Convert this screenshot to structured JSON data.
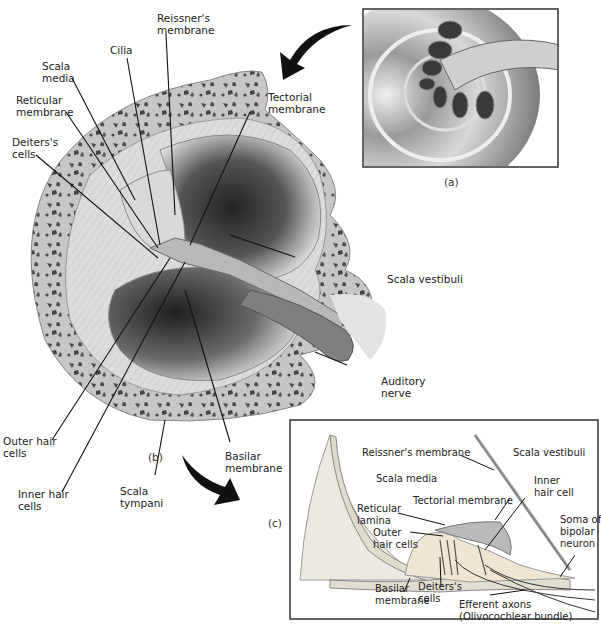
{
  "figure": {
    "panels": {
      "a": {
        "caption": "(a)",
        "subject": "coiled cochlea with auditory nerve"
      },
      "b": {
        "caption": "(b)",
        "subject": "cross-section of one cochlear turn"
      },
      "c": {
        "caption": "(c)",
        "subject": "organ of Corti detail"
      }
    }
  },
  "labels_b": {
    "reissners_membrane": [
      "Reissner's",
      "membrane"
    ],
    "cilia": [
      "Cilia"
    ],
    "scala_media": [
      "Scala",
      "media"
    ],
    "reticular_membrane": [
      "Reticular",
      "membrane"
    ],
    "deiters_cells": [
      "Deiters's",
      "cells"
    ],
    "tectorial_membrane": [
      "Tectorial",
      "membrane"
    ],
    "scala_vestibuli": [
      "Scala vestibuli"
    ],
    "auditory_nerve": [
      "Auditory",
      "nerve"
    ],
    "outer_hair_cells": [
      "Outer hair",
      "cells"
    ],
    "inner_hair_cells": [
      "Inner hair",
      "cells"
    ],
    "scala_tympani": [
      "Scala",
      "tympani"
    ],
    "basilar_membrane": [
      "Basilar",
      "membrane"
    ]
  },
  "labels_c": {
    "reissners_membrane": [
      "Reissner's membrane"
    ],
    "scala_vestibuli": [
      "Scala vestibuli"
    ],
    "scala_media": [
      "Scala media"
    ],
    "inner_hair_cell": [
      "Inner",
      "hair cell"
    ],
    "tectorial_membrane": [
      "Tectorial membrane"
    ],
    "reticular_lamina": [
      "Reticular",
      "lamina"
    ],
    "outer_hair_cells": [
      "Outer",
      "hair cells"
    ],
    "soma_bipolar_neuron": [
      "Soma of",
      "bipolar",
      "neuron"
    ],
    "basilar_membrane": [
      "Basilar",
      "membrane"
    ],
    "deiters_cells": [
      "Deiters's",
      "cells"
    ],
    "efferent_axons": [
      "Efferent axons",
      "(Olivocochlear bundle)"
    ]
  },
  "colors": {
    "bone": "#c9c9c9",
    "bone_spots": "#4a4a4a",
    "chamber_dark": "#2a2a2a",
    "chamber_light": "#e6e6e6",
    "leader_line": "#111111",
    "panel_border": "#333333"
  }
}
